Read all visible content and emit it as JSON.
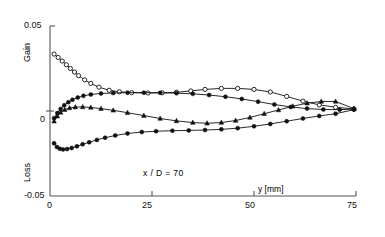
{
  "chart_data": {
    "type": "line",
    "title": "",
    "subtitle": "",
    "xlabel": "y [mm]",
    "ylabel": "",
    "ylabel_upper": "Gain",
    "ylabel_lower": "Loss",
    "xlim": [
      0,
      75
    ],
    "ylim": [
      -0.05,
      0.05
    ],
    "xticks": [
      0,
      25,
      50,
      75
    ],
    "xtick_labels": [
      "0",
      "25",
      "50",
      "75"
    ],
    "yticks": [
      -0.05,
      0,
      0.05
    ],
    "ytick_labels": [
      "-0.05",
      "0",
      "0.05"
    ],
    "grid": false,
    "legend": "none",
    "annotations": [
      {
        "text": "x / D = 70",
        "x": 30,
        "y": -0.038
      }
    ],
    "series": [
      {
        "name": "series-1-open-circles-decaying",
        "marker": "open-circle",
        "points": [
          [
            1.0,
            0.0335
          ],
          [
            2.0,
            0.0315
          ],
          [
            3.0,
            0.0294
          ],
          [
            4.0,
            0.0272
          ],
          [
            5.0,
            0.025
          ],
          [
            6.0,
            0.0229
          ],
          [
            7.0,
            0.0208
          ],
          [
            8.5,
            0.0183
          ],
          [
            10.0,
            0.0162
          ],
          [
            12.0,
            0.014
          ],
          [
            14.5,
            0.0122
          ],
          [
            17.0,
            0.0113
          ],
          [
            20.0,
            0.0108
          ],
          [
            24.0,
            0.0106
          ],
          [
            27.5,
            0.0107
          ],
          [
            31.0,
            0.011
          ],
          [
            34.5,
            0.0118
          ],
          [
            38.0,
            0.0127
          ],
          [
            42.0,
            0.0133
          ],
          [
            46.0,
            0.0133
          ],
          [
            50.0,
            0.0127
          ],
          [
            54.0,
            0.0112
          ],
          [
            58.0,
            0.0086
          ],
          [
            62.0,
            0.0058
          ],
          [
            66.0,
            0.0036
          ],
          [
            70.0,
            0.0022
          ],
          [
            74.5,
            0.0012
          ]
        ]
      },
      {
        "name": "series-2-filled-rising-plateau",
        "marker": "filled-circle",
        "points": [
          [
            1.0,
            -0.0042
          ],
          [
            1.8,
            -0.0012
          ],
          [
            2.6,
            0.0012
          ],
          [
            3.5,
            0.0034
          ],
          [
            4.5,
            0.0052
          ],
          [
            5.5,
            0.0066
          ],
          [
            6.8,
            0.0079
          ],
          [
            8.2,
            0.0089
          ],
          [
            10.0,
            0.0097
          ],
          [
            12.5,
            0.0103
          ],
          [
            15.5,
            0.0106
          ],
          [
            19.0,
            0.0108
          ],
          [
            23.0,
            0.0108
          ],
          [
            27.0,
            0.0107
          ],
          [
            31.0,
            0.0105
          ],
          [
            35.0,
            0.0101
          ],
          [
            39.0,
            0.0094
          ],
          [
            43.0,
            0.0084
          ],
          [
            47.0,
            0.0071
          ],
          [
            51.0,
            0.0055
          ],
          [
            55.0,
            0.0038
          ],
          [
            59.0,
            0.0024
          ],
          [
            63.0,
            0.0014
          ],
          [
            67.0,
            0.0009
          ],
          [
            71.0,
            0.0008
          ],
          [
            74.5,
            0.0011
          ]
        ]
      },
      {
        "name": "series-3-filled-triangles-dip-recover",
        "marker": "filled-triangle",
        "points": [
          [
            1.0,
            -0.006
          ],
          [
            1.8,
            -0.003
          ],
          [
            2.6,
            -0.0008
          ],
          [
            3.6,
            0.0008
          ],
          [
            4.8,
            0.0018
          ],
          [
            6.2,
            0.0023
          ],
          [
            8.0,
            0.0024
          ],
          [
            10.0,
            0.0021
          ],
          [
            12.5,
            0.0014
          ],
          [
            15.5,
            0.0004
          ],
          [
            19.0,
            -0.001
          ],
          [
            23.0,
            -0.0027
          ],
          [
            27.0,
            -0.0044
          ],
          [
            31.0,
            -0.0058
          ],
          [
            35.0,
            -0.0068
          ],
          [
            38.5,
            -0.0072
          ],
          [
            42.0,
            -0.0068
          ],
          [
            45.5,
            -0.0056
          ],
          [
            49.0,
            -0.0038
          ],
          [
            52.5,
            -0.0016
          ],
          [
            56.0,
            0.0006
          ],
          [
            59.5,
            0.0028
          ],
          [
            63.0,
            0.0046
          ],
          [
            66.5,
            0.0056
          ],
          [
            70.0,
            0.0056
          ],
          [
            74.5,
            0.0014
          ]
        ]
      },
      {
        "name": "series-4-filled-loss-recovery",
        "marker": "filled-circle",
        "points": [
          [
            1.0,
            -0.019
          ],
          [
            1.7,
            -0.0212
          ],
          [
            2.4,
            -0.0222
          ],
          [
            3.2,
            -0.0226
          ],
          [
            4.2,
            -0.0224
          ],
          [
            5.3,
            -0.0218
          ],
          [
            6.6,
            -0.0208
          ],
          [
            8.0,
            -0.0196
          ],
          [
            9.6,
            -0.0184
          ],
          [
            11.5,
            -0.017
          ],
          [
            13.5,
            -0.0157
          ],
          [
            16.0,
            -0.0144
          ],
          [
            19.0,
            -0.0132
          ],
          [
            22.5,
            -0.0124
          ],
          [
            26.0,
            -0.0119
          ],
          [
            30.0,
            -0.0116
          ],
          [
            34.0,
            -0.0114
          ],
          [
            38.0,
            -0.0112
          ],
          [
            42.0,
            -0.0108
          ],
          [
            46.0,
            -0.0101
          ],
          [
            50.0,
            -0.009
          ],
          [
            54.0,
            -0.0076
          ],
          [
            58.0,
            -0.006
          ],
          [
            62.0,
            -0.0044
          ],
          [
            66.0,
            -0.0029
          ],
          [
            70.0,
            -0.0016
          ],
          [
            74.5,
            0.0008
          ]
        ]
      }
    ]
  },
  "axis": {
    "y_top_label": "0.05",
    "y_zero_label": "0",
    "y_bottom_label": "-0.05",
    "x_labels": [
      "0",
      "25",
      "50",
      "75"
    ],
    "x_title": "y [mm]",
    "gain_label": "Gain",
    "loss_label": "Loss",
    "annotation": "x / D = 70"
  },
  "style": {
    "line_color": "#111111",
    "marker_fill": "#111111",
    "marker_open_fill": "#ffffff",
    "axis_color": "#555555",
    "background": "#ffffff"
  }
}
